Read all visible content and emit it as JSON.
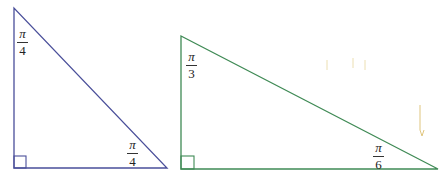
{
  "diagram": {
    "triangles": [
      {
        "name": "isosceles-right-triangle",
        "color": "#4a4f9a",
        "angles": [
          {
            "vertex": "top",
            "numerator": "π",
            "denominator": "4"
          },
          {
            "vertex": "bottom-right",
            "numerator": "π",
            "denominator": "4"
          },
          {
            "vertex": "bottom-left",
            "label": "right angle"
          }
        ]
      },
      {
        "name": "30-60-90-triangle",
        "color": "#3f8a55",
        "angles": [
          {
            "vertex": "top",
            "numerator": "π",
            "denominator": "3"
          },
          {
            "vertex": "bottom-right",
            "numerator": "π",
            "denominator": "6"
          },
          {
            "vertex": "bottom-left",
            "label": "right angle"
          }
        ]
      }
    ]
  }
}
